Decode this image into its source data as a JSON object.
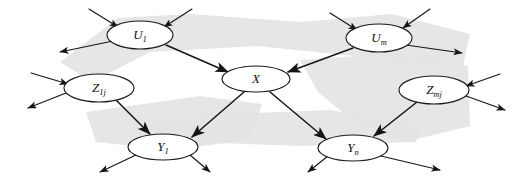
{
  "figure": {
    "kind": "causal-diagram",
    "width": 528,
    "height": 181,
    "background_color": "#ffffff",
    "ink_color": "#151515",
    "watermark_color": "#e3e3e3"
  },
  "nodes": [
    {
      "id": "u1",
      "name": "node-u1",
      "base": "U",
      "sub": "1",
      "label": "U1",
      "cx": 140,
      "cy": 35,
      "rx": 33,
      "ry": 14
    },
    {
      "id": "um",
      "name": "node-um",
      "base": "U",
      "sub": "m",
      "label": "Um",
      "cx": 379,
      "cy": 38,
      "rx": 33,
      "ry": 14
    },
    {
      "id": "x",
      "name": "node-x",
      "base": "X",
      "sub": "",
      "label": "X",
      "cx": 256,
      "cy": 79,
      "rx": 34,
      "ry": 13
    },
    {
      "id": "z1j",
      "name": "node-z1j",
      "base": "Z",
      "sub": "1j",
      "label": "Z1j",
      "cx": 99,
      "cy": 88,
      "rx": 35,
      "ry": 14
    },
    {
      "id": "zmj",
      "name": "node-zmj",
      "base": "Z",
      "sub": "mj",
      "label": "Zmj",
      "cx": 434,
      "cy": 90,
      "rx": 35,
      "ry": 14
    },
    {
      "id": "y1",
      "name": "node-y1",
      "base": "Y",
      "sub": "1",
      "label": "Y1",
      "cx": 163,
      "cy": 147,
      "rx": 35,
      "ry": 13
    },
    {
      "id": "yn",
      "name": "node-yn",
      "base": "Y",
      "sub": "n",
      "label": "Yn",
      "cx": 353,
      "cy": 148,
      "rx": 35,
      "ry": 13
    }
  ],
  "edges": [
    {
      "id": "u1-to-x",
      "name": "edge-u1-to-x",
      "from": "u1",
      "to": "x",
      "x1": 166,
      "y1": 45,
      "x2": 228,
      "y2": 72
    },
    {
      "id": "um-to-x",
      "name": "edge-um-to-x",
      "from": "um",
      "to": "x",
      "x1": 353,
      "y1": 48,
      "x2": 288,
      "y2": 72
    },
    {
      "id": "x-to-y1",
      "name": "edge-x-to-y1",
      "from": "x",
      "to": "y1",
      "x1": 244,
      "y1": 92,
      "x2": 192,
      "y2": 137
    },
    {
      "id": "x-to-yn",
      "name": "edge-x-to-yn",
      "from": "x",
      "to": "yn",
      "x1": 270,
      "y1": 92,
      "x2": 326,
      "y2": 139
    },
    {
      "id": "z1j-to-y1",
      "name": "edge-z1j-to-y1",
      "from": "z1j",
      "to": "y1",
      "x1": 116,
      "y1": 100,
      "x2": 150,
      "y2": 134
    },
    {
      "id": "zmj-to-yn",
      "name": "edge-zmj-to-yn",
      "from": "zmj",
      "to": "yn",
      "x1": 417,
      "y1": 102,
      "x2": 374,
      "y2": 136
    }
  ],
  "exogenous_edges": [
    {
      "id": "in-u1-a",
      "name": "edge-in-u1-left",
      "x1": 89,
      "y1": 9,
      "x2": 118,
      "y2": 27,
      "direction": "in"
    },
    {
      "id": "in-u1-b",
      "name": "edge-in-u1-right",
      "x1": 192,
      "y1": 9,
      "x2": 164,
      "y2": 27,
      "direction": "in"
    },
    {
      "id": "out-u1",
      "name": "edge-out-u1-left",
      "x1": 113,
      "y1": 41,
      "x2": 60,
      "y2": 52,
      "direction": "out"
    },
    {
      "id": "in-um-a",
      "name": "edge-in-um-left",
      "x1": 330,
      "y1": 13,
      "x2": 357,
      "y2": 30,
      "direction": "in"
    },
    {
      "id": "in-um-b",
      "name": "edge-in-um-right",
      "x1": 430,
      "y1": 9,
      "x2": 403,
      "y2": 28,
      "direction": "in"
    },
    {
      "id": "out-um",
      "name": "edge-out-um-right",
      "x1": 406,
      "y1": 45,
      "x2": 462,
      "y2": 53,
      "direction": "out"
    },
    {
      "id": "in-z1j",
      "name": "edge-in-z1j",
      "x1": 31,
      "y1": 73,
      "x2": 68,
      "y2": 84,
      "direction": "in"
    },
    {
      "id": "out-z1j",
      "name": "edge-out-z1j",
      "x1": 66,
      "y1": 93,
      "x2": 28,
      "y2": 108,
      "direction": "out"
    },
    {
      "id": "in-zmj",
      "name": "edge-in-zmj",
      "x1": 500,
      "y1": 74,
      "x2": 466,
      "y2": 86,
      "direction": "in"
    },
    {
      "id": "out-zmj",
      "name": "edge-out-zmj",
      "x1": 466,
      "y1": 96,
      "x2": 505,
      "y2": 110,
      "direction": "out"
    },
    {
      "id": "out-y1-a",
      "name": "edge-out-y1-left",
      "x1": 136,
      "y1": 155,
      "x2": 100,
      "y2": 172,
      "direction": "out"
    },
    {
      "id": "out-y1-b",
      "name": "edge-out-y1-right",
      "x1": 190,
      "y1": 155,
      "x2": 210,
      "y2": 172,
      "direction": "out"
    },
    {
      "id": "out-yn-a",
      "name": "edge-out-yn-left",
      "x1": 328,
      "y1": 156,
      "x2": 308,
      "y2": 172,
      "direction": "out"
    },
    {
      "id": "out-yn-b",
      "name": "edge-out-yn-right",
      "x1": 381,
      "y1": 156,
      "x2": 440,
      "y2": 170,
      "direction": "out"
    }
  ],
  "watermark_shapes": [
    {
      "name": "watermark-band-upper",
      "points": "60,62 118,18 190,14 300,22 392,14 470,34 462,70 372,58 258,46 150,52 92,82"
    },
    {
      "name": "watermark-band-right",
      "points": "300,60 410,52 468,66 470,126 404,142 352,120 318,92"
    },
    {
      "name": "watermark-band-lower",
      "points": "86,112 200,96 262,104 250,140 170,150 96,142"
    },
    {
      "name": "watermark-band-sweep",
      "points": "130,118 330,110 420,126 416,142 300,146 140,140"
    }
  ]
}
